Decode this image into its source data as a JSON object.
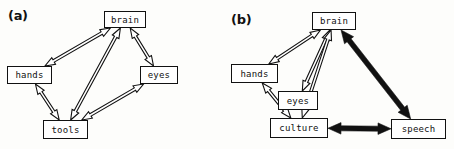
{
  "figure": {
    "panels": [
      {
        "id": "a",
        "label": "(a)",
        "nodes": [
          {
            "name": "brain",
            "label": "brain",
            "x": 104,
            "y": 11,
            "w": 42,
            "h": 17
          },
          {
            "name": "hands",
            "label": "hands",
            "x": 7,
            "y": 66,
            "w": 45,
            "h": 18
          },
          {
            "name": "eyes",
            "label": "eyes",
            "x": 140,
            "y": 66,
            "w": 38,
            "h": 18
          },
          {
            "name": "tools",
            "label": "tools",
            "x": 43,
            "y": 120,
            "w": 45,
            "h": 19
          }
        ],
        "edges": [
          {
            "from": "hands",
            "to": "brain",
            "style": "hollow",
            "arrows": "both"
          },
          {
            "from": "brain",
            "to": "eyes",
            "style": "hollow",
            "arrows": "both"
          },
          {
            "from": "brain",
            "to": "tools",
            "style": "hollow",
            "arrows": "both"
          },
          {
            "from": "hands",
            "to": "tools",
            "style": "hollow",
            "arrows": "both"
          },
          {
            "from": "eyes",
            "to": "tools",
            "style": "hollow",
            "arrows": "both"
          }
        ]
      },
      {
        "id": "b",
        "label": "(b)",
        "nodes": [
          {
            "name": "brain",
            "label": "brain",
            "x": 85,
            "y": 12,
            "w": 44,
            "h": 18
          },
          {
            "name": "hands",
            "label": "hands",
            "x": 4,
            "y": 64,
            "w": 47,
            "h": 19
          },
          {
            "name": "eyes",
            "label": "eyes",
            "x": 51,
            "y": 91,
            "w": 40,
            "h": 19
          },
          {
            "name": "culture",
            "label": "culture",
            "x": 43,
            "y": 118,
            "w": 58,
            "h": 20
          },
          {
            "name": "speech",
            "label": "speech",
            "x": 164,
            "y": 119,
            "w": 55,
            "h": 20
          }
        ],
        "edges": [
          {
            "from": "hands",
            "to": "brain",
            "style": "hollow",
            "arrows": "both"
          },
          {
            "from": "eyes",
            "to": "brain",
            "style": "hollow",
            "arrows": "both"
          },
          {
            "from": "culture",
            "to": "brain",
            "style": "hollow",
            "arrows": "both"
          },
          {
            "from": "hands",
            "to": "culture",
            "style": "hollow",
            "arrows": "both"
          },
          {
            "from": "brain",
            "to": "speech",
            "style": "solid",
            "arrows": "both"
          },
          {
            "from": "culture",
            "to": "speech",
            "style": "solid",
            "arrows": "both"
          }
        ]
      }
    ]
  }
}
